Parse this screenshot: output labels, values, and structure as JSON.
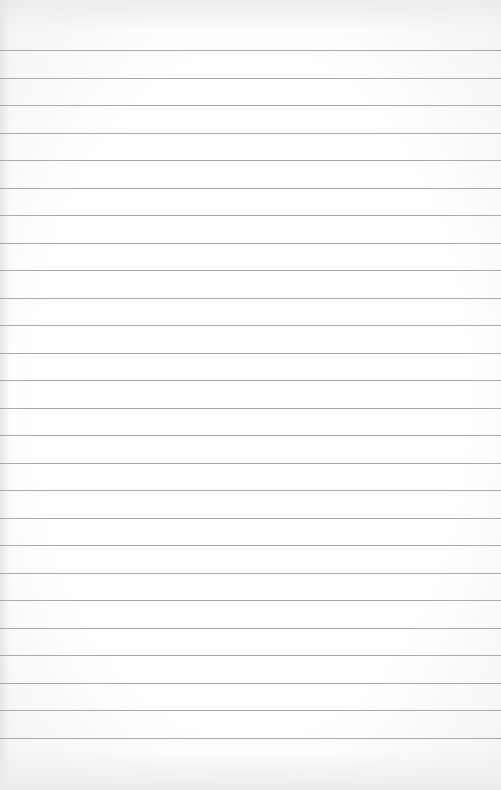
{
  "paper": {
    "type": "lined-paper",
    "line_count": 26,
    "first_line_y": 50,
    "line_spacing": 27.5,
    "line_color": "#a9a9a9",
    "background_color": "#ffffff"
  }
}
